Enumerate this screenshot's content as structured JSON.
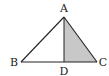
{
  "diagram": {
    "type": "triangle",
    "points": {
      "A": {
        "label": "A",
        "x": 64,
        "y": 17
      },
      "B": {
        "label": "B",
        "x": 21,
        "y": 62
      },
      "C": {
        "label": "C",
        "x": 97,
        "y": 62
      },
      "D": {
        "label": "D",
        "x": 64,
        "y": 62
      }
    },
    "segments": [
      "AB",
      "AC",
      "BC",
      "AD"
    ],
    "shaded_region": "ADC",
    "colors": {
      "stroke": "#222222",
      "shade": "#c8c8c8",
      "background": "#ffffff"
    }
  }
}
